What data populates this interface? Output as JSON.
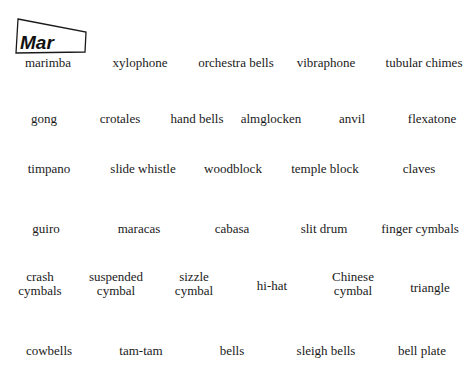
{
  "colors": {
    "ink": "#1a1a1a",
    "background": "#ffffff"
  },
  "rows": [
    {
      "items": [
        {
          "label": "marimba",
          "icon": "marimba-box-icon",
          "abbr": "Mar"
        },
        {
          "label": "xylophone",
          "icon": "xylophone-box-icon",
          "abbr": "Xyle"
        },
        {
          "label": "orchestra bells",
          "icon": "orchestra-bells-box-icon",
          "abbr": "Glsp"
        },
        {
          "label": "vibraphone",
          "icon": "vibraphone-box-icon",
          "abbr": "Vib"
        },
        {
          "label": "tubular chimes",
          "icon": "tubular-chimes-icon"
        }
      ]
    },
    {
      "items": [
        {
          "label": "gong",
          "icon": "gong-icon"
        },
        {
          "label": "crotales",
          "icon": "crotales-icon"
        },
        {
          "label": "hand bells",
          "icon": "hand-bells-icon",
          "bell_letters": [
            "A",
            "E"
          ]
        },
        {
          "label": "almglocken",
          "icon": "almglocken-icon"
        },
        {
          "label": "anvil",
          "icon": "anvil-icon"
        },
        {
          "label": "flexatone",
          "icon": "flexatone-icon"
        }
      ]
    },
    {
      "items": [
        {
          "label": "timpano",
          "icon": "timpano-icon",
          "drum_marks": [
            "",
            "30\"",
            "25\""
          ]
        },
        {
          "label": "slide whistle",
          "icon": "slide-whistle-icon"
        },
        {
          "label": "woodblock",
          "icon": "woodblock-icon"
        },
        {
          "label": "temple block",
          "icon": "temple-block-icon"
        },
        {
          "label": "claves",
          "icon": "claves-icon"
        }
      ]
    },
    {
      "items": [
        {
          "label": "guiro",
          "icon": "guiro-icon"
        },
        {
          "label": "maracas",
          "icon": "maracas-icon"
        },
        {
          "label": "cabasa",
          "icon": "cabasa-icon"
        },
        {
          "label": "slit drum",
          "icon": "slit-drum-icon"
        },
        {
          "label": "finger cymbals",
          "icon": "finger-cymbals-icon"
        }
      ]
    },
    {
      "items": [
        {
          "label_lines": [
            "crash",
            "cymbals"
          ],
          "icon": "crash-cymbals-icon"
        },
        {
          "label_lines": [
            "suspended",
            "cymbal"
          ],
          "icon": "suspended-cymbal-icon"
        },
        {
          "label_lines": [
            "sizzle",
            "cymbal"
          ],
          "icon": "sizzle-cymbal-icon"
        },
        {
          "label": "hi-hat",
          "icon": "hi-hat-icon"
        },
        {
          "label_lines": [
            "Chinese",
            "cymbal"
          ],
          "icon": "chinese-cymbal-icon"
        },
        {
          "label": "triangle",
          "icon": "triangle-icon"
        }
      ]
    },
    {
      "items": [
        {
          "label": "cowbells",
          "icon": "cowbells-icon"
        },
        {
          "label": "tam-tam",
          "icon": "tam-tam-icon"
        },
        {
          "label": "bells",
          "icon": "bells-icon"
        },
        {
          "label": "sleigh bells",
          "icon": "sleigh-bells-icon"
        },
        {
          "label": "bell plate",
          "icon": "bell-plate-icon"
        }
      ]
    }
  ]
}
